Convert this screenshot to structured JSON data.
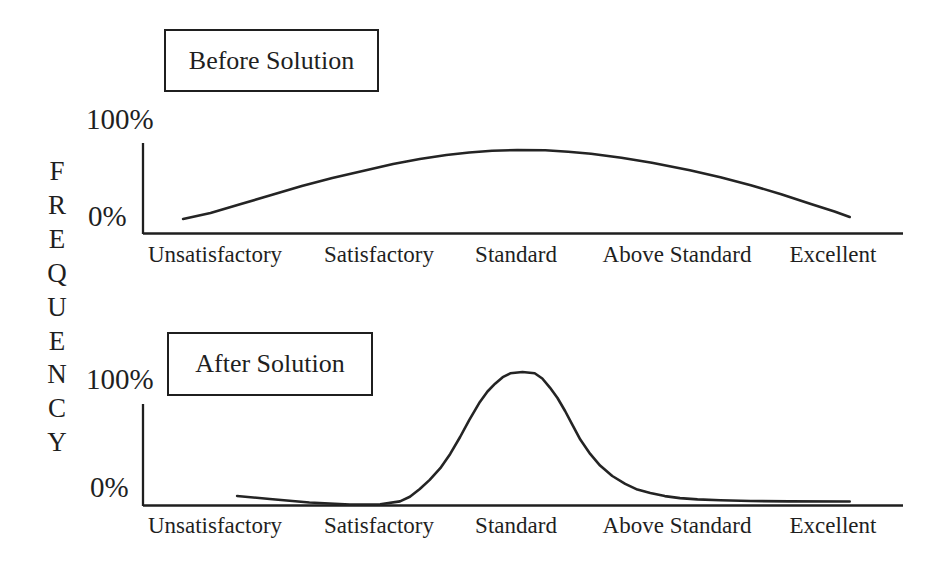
{
  "ink_color": "#1f1f1f",
  "ylabel": "FREQUENCY",
  "categories": [
    "Unsatisfactory",
    "Satisfactory",
    "Standard",
    "Above Standard",
    "Excellent"
  ],
  "chart_data": [
    {
      "id": "before",
      "type": "line",
      "title": "Before Solution",
      "ylabel": "FREQUENCY",
      "y_axis_labels": [
        "100%",
        "0%"
      ],
      "ylim": [
        0,
        100
      ],
      "grid": false,
      "legend": "none",
      "categories": [
        "Unsatisfactory",
        "Satisfactory",
        "Standard",
        "Above Standard",
        "Excellent"
      ],
      "approx_values_pct": [
        8,
        54,
        69,
        50,
        6
      ],
      "peak_category": "Standard",
      "shape": "broad shallow bell curve spanning all categories",
      "curve_points_fx_pct": [
        [
          5.4,
          0
        ],
        [
          9,
          6
        ],
        [
          13,
          15
        ],
        [
          17,
          24
        ],
        [
          21,
          33
        ],
        [
          25,
          41
        ],
        [
          29,
          48
        ],
        [
          33,
          55
        ],
        [
          36.5,
          60
        ],
        [
          40,
          64
        ],
        [
          43,
          66.5
        ],
        [
          46,
          68.3
        ],
        [
          49.3,
          69
        ],
        [
          53,
          68.7
        ],
        [
          56,
          67.3
        ],
        [
          59,
          65.3
        ],
        [
          63,
          61.3
        ],
        [
          67,
          56.3
        ],
        [
          72,
          48.8
        ],
        [
          76,
          41.8
        ],
        [
          80,
          33.8
        ],
        [
          84,
          24.8
        ],
        [
          88,
          14.8
        ],
        [
          91,
          7.5
        ],
        [
          93,
          2
        ]
      ]
    },
    {
      "id": "after",
      "type": "line",
      "title": "After Solution",
      "ylabel": "FREQUENCY",
      "y_axis_labels": [
        "100%",
        "0%"
      ],
      "ylim": [
        0,
        100
      ],
      "grid": false,
      "legend": "none",
      "categories": [
        "Unsatisfactory",
        "Satisfactory",
        "Standard",
        "Above Standard",
        "Excellent"
      ],
      "approx_values_pct": [
        3,
        0,
        100,
        3,
        1
      ],
      "peak_category": "Standard",
      "shape": "narrow tall bell curve centered on Standard reaching 100%",
      "curve_points_fx_pct": [
        [
          12.5,
          4.6
        ],
        [
          16.8,
          2.3
        ],
        [
          22,
          -0.4
        ],
        [
          27.3,
          -1.9
        ],
        [
          31.3,
          -1.8
        ],
        [
          33.9,
          0.5
        ],
        [
          35.2,
          4
        ],
        [
          36.5,
          10
        ],
        [
          37.8,
          17
        ],
        [
          39.2,
          26
        ],
        [
          40.5,
          37
        ],
        [
          41.8,
          50
        ],
        [
          43,
          63
        ],
        [
          44.4,
          77
        ],
        [
          45.4,
          85
        ],
        [
          46.4,
          91
        ],
        [
          47.4,
          96
        ],
        [
          48.4,
          99
        ],
        [
          50,
          100
        ],
        [
          51.6,
          99
        ],
        [
          52.6,
          95
        ],
        [
          53.6,
          88
        ],
        [
          54.6,
          80
        ],
        [
          55.6,
          70
        ],
        [
          56.6,
          59
        ],
        [
          57.6,
          48
        ],
        [
          58.9,
          37
        ],
        [
          60.2,
          28
        ],
        [
          61.8,
          20
        ],
        [
          63.5,
          14
        ],
        [
          65.1,
          9.5
        ],
        [
          66.8,
          7
        ],
        [
          68.7,
          4.5
        ],
        [
          70.7,
          3
        ],
        [
          73,
          2
        ],
        [
          76,
          1.3
        ],
        [
          80,
          0.8
        ],
        [
          85,
          0.5
        ],
        [
          93,
          0.4
        ]
      ]
    }
  ]
}
